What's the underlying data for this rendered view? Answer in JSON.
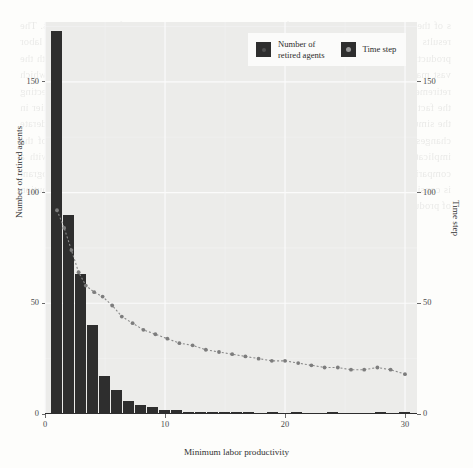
{
  "chart_data": {
    "type": "bar",
    "title": "",
    "xlabel": "Minimum labor productivity",
    "ylabel": "Number of retired agents",
    "y2label": "Time step",
    "xlim": [
      0,
      31
    ],
    "ylim": [
      0,
      177
    ],
    "y2lim": [
      0,
      177
    ],
    "xticks": [
      0,
      10,
      20,
      30
    ],
    "xtick_labels": [
      "0",
      "10",
      "20",
      "30"
    ],
    "yticks": [
      0,
      50,
      100,
      150
    ],
    "ytick_labels": [
      "0",
      "50",
      "100",
      "150"
    ],
    "y2ticks": [
      0,
      50,
      100,
      150
    ],
    "y2tick_labels": [
      "0",
      "50",
      "100",
      "150"
    ],
    "grid": true,
    "legend_position": "top-right",
    "series": [
      {
        "name": "Number of retired agents",
        "type": "bar",
        "axis": "left",
        "color": "#2e2e2e",
        "bin_width": 1,
        "x": [
          1,
          2,
          3,
          4,
          5,
          6,
          7,
          8,
          9,
          10,
          11,
          12,
          13,
          14,
          15,
          16,
          17,
          18,
          19,
          20,
          21,
          22,
          23,
          24,
          25,
          26,
          27,
          28,
          29,
          30
        ],
        "values": [
          173,
          90,
          63,
          40,
          17,
          11,
          6,
          4,
          3,
          2,
          2,
          1,
          1,
          1,
          1,
          1,
          1,
          0,
          1,
          0,
          1,
          0,
          0,
          1,
          0,
          0,
          0,
          1,
          0,
          1
        ]
      },
      {
        "name": "Time step",
        "type": "line",
        "axis": "right",
        "color": "#8a8a8a",
        "linestyle": "dotted",
        "marker": "circle",
        "x": [
          1,
          1.6,
          2.2,
          2.8,
          3.4,
          4.1,
          4.8,
          5.6,
          6.4,
          7.3,
          8.2,
          9.2,
          10.2,
          11.2,
          12.3,
          13.4,
          14.5,
          15.6,
          16.7,
          17.8,
          18.9,
          20.0,
          21.1,
          22.2,
          23.3,
          24.4,
          25.5,
          26.6,
          27.7,
          28.8,
          30.0
        ],
        "values": [
          92,
          84,
          74,
          64,
          58,
          55,
          53,
          49,
          44,
          41,
          38,
          36,
          34,
          32,
          31,
          29,
          28,
          27,
          26,
          25,
          24,
          24,
          23,
          22,
          21,
          21,
          20,
          20,
          21,
          20,
          18
        ]
      }
    ]
  },
  "legend": {
    "items": [
      {
        "label_line1": "Number of",
        "label_line2": "retired agents"
      },
      {
        "label_line1": "Time step",
        "label_line2": ""
      }
    ]
  },
  "background_text": "s of the model and the calibration of the parameters are presented in the following sections. The results obtained from the simulation runs indicate that the distribution of minimum labor productivity across retired agents is strongly skewed toward the lower end of the range, with the vast majority of agents retiring at relatively low productivity thresholds. The time step at which retirement occurs declines monotonically as the minimum labor productivity increases, reflecting the fact that agents with higher productivity requirements tend to exit the labor market earlier in the simulation horizon. These patterns are robust to variations in the initial seed and to moderate changes in the matching probability. A further discussion of the sensitivity analysis and of the implications for the aggregate dynamics of unemployment is provided below, together with a comparison with the benchmark specification reported in the appendix. The shape of the histogram is consistent with the theoretical prediction derived in Section 3, where the stationary distribution of productivity thresholds was shown to follow an approximately exponential decay."
}
